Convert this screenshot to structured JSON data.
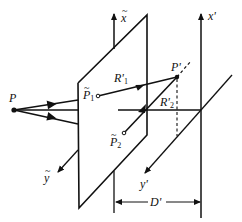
{
  "diagram": {
    "type": "optical-geometry",
    "colors": {
      "stroke": "#111111",
      "background": "#ffffff"
    },
    "labels": {
      "P": "P",
      "P_tilde_1": {
        "base": "P",
        "sub": "1",
        "accent": "~"
      },
      "P_tilde_2": {
        "base": "P",
        "sub": "2",
        "accent": "~"
      },
      "R1_prime": {
        "base": "R'",
        "sub": "1"
      },
      "R2_prime": {
        "base": "R'",
        "sub": "2"
      },
      "P_prime": "P'",
      "x_tilde": {
        "base": "x",
        "accent": "~"
      },
      "y_tilde": {
        "base": "y",
        "accent": "~"
      },
      "x_prime": "x'",
      "y_prime": "y'",
      "D_prime": "D'"
    },
    "nodes": [
      {
        "id": "P",
        "x": 14,
        "y": 110
      },
      {
        "id": "P_tilde_1",
        "x": 98,
        "y": 96
      },
      {
        "id": "P_tilde_2",
        "x": 124,
        "y": 133
      },
      {
        "id": "P_prime",
        "x": 177,
        "y": 77
      }
    ]
  }
}
